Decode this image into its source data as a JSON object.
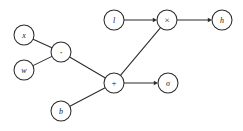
{
  "diagram": {
    "type": "directed-graph",
    "background_color": "#ffffff",
    "stroke_color": "#2b2b2b",
    "node_fill_color": "#ffffff",
    "node_radius": 10,
    "canvas": {
      "width": 243,
      "height": 131
    },
    "nodes": [
      {
        "id": "x",
        "label": "x",
        "cx": 24,
        "cy": 35,
        "kind": "variable",
        "style": "italic"
      },
      {
        "id": "w",
        "label": "w",
        "cx": 24,
        "cy": 70,
        "kind": "variable",
        "style": "italic"
      },
      {
        "id": "mul",
        "label": "·",
        "cx": 61,
        "cy": 52,
        "kind": "operator",
        "style": "dot"
      },
      {
        "id": "b",
        "label": "b",
        "cx": 61,
        "cy": 111,
        "kind": "variable",
        "style": "italic"
      },
      {
        "id": "plus",
        "label": "+",
        "cx": 114,
        "cy": 83,
        "kind": "operator",
        "style": "op"
      },
      {
        "id": "sigma",
        "label": "σ",
        "cx": 168,
        "cy": 83,
        "kind": "operator",
        "style": "italic"
      },
      {
        "id": "l",
        "label": "l",
        "cx": 114,
        "cy": 20,
        "kind": "variable",
        "style": "italic"
      },
      {
        "id": "times",
        "label": "×",
        "cx": 167,
        "cy": 20,
        "kind": "operator",
        "style": "op"
      },
      {
        "id": "h",
        "label": "h",
        "cx": 222,
        "cy": 20,
        "kind": "variable",
        "style": "italic"
      }
    ],
    "edges": [
      {
        "id": "x-mul",
        "from": "x",
        "to": "mul",
        "arrow": false
      },
      {
        "id": "w-mul",
        "from": "w",
        "to": "mul",
        "arrow": false
      },
      {
        "id": "mul-plus",
        "from": "mul",
        "to": "plus",
        "arrow": false
      },
      {
        "id": "b-plus",
        "from": "b",
        "to": "plus",
        "arrow": false
      },
      {
        "id": "plus-sigma",
        "from": "plus",
        "to": "sigma",
        "arrow": true
      },
      {
        "id": "plus-times",
        "from": "plus",
        "to": "times",
        "arrow": false
      },
      {
        "id": "l-times",
        "from": "l",
        "to": "times",
        "arrow": true
      },
      {
        "id": "times-h",
        "from": "times",
        "to": "h",
        "arrow": true
      }
    ]
  }
}
